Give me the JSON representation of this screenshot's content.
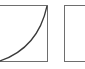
{
  "diagram": {
    "panels": [
      {
        "id": "left",
        "content": "curve",
        "curve": "ease-in (convex, bottom-left to top-right)"
      },
      {
        "id": "right",
        "content": "empty"
      }
    ],
    "colors": {
      "stroke": "#6e6e6e",
      "curve": "#3a3a3a",
      "background": "#ffffff"
    }
  }
}
